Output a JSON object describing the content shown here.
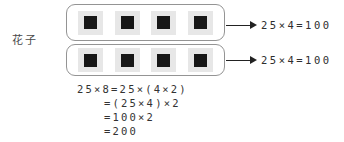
{
  "student_label": "花子",
  "groups": [
    {
      "square_count": 4,
      "result": "25×4=100"
    },
    {
      "square_count": 4,
      "result": "25×4=100"
    }
  ],
  "equations": {
    "lines": [
      "25×8=25×(4×2)",
      "=(25×4)×2",
      "=100×2",
      "=200"
    ]
  },
  "colors": {
    "box_border": "#949494",
    "square_bg": "#e7e7e7",
    "square_fill": "#171717",
    "text": "#333333",
    "arrow": "#222222",
    "page_bg": "#ffffff"
  }
}
